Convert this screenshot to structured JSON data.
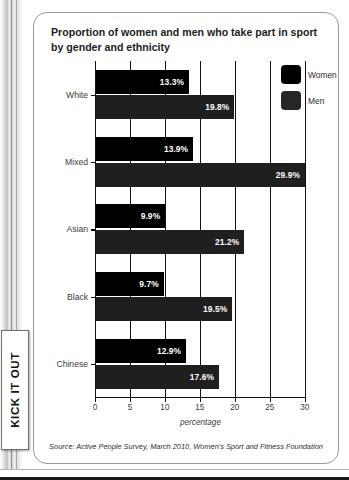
{
  "brand": {
    "tab_label": "KICK IT OUT"
  },
  "card": {
    "title": "Proportion of women and men who take part in sport by gender and ethnicity",
    "source": "Source: Active People Survey, March 2010, Women's Sport and Fitness Foundation"
  },
  "legend": {
    "items": [
      {
        "label": "Women",
        "color": "#000000"
      },
      {
        "label": "Men",
        "color": "#262626"
      }
    ]
  },
  "axis": {
    "x_ticks": [
      "0",
      "5",
      "10",
      "15",
      "20",
      "25",
      "30"
    ],
    "x_title": "percentage"
  },
  "chart_data": {
    "type": "bar",
    "orientation": "horizontal",
    "title": "Proportion of women and men who take part in sport by gender and ethnicity",
    "xlabel": "percentage",
    "ylabel": "",
    "xlim": [
      0,
      30
    ],
    "xticks": [
      0,
      5,
      10,
      15,
      20,
      25,
      30
    ],
    "grid": true,
    "legend_position": "top-right",
    "categories": [
      "White",
      "Mixed",
      "Asian",
      "Black",
      "Chinese"
    ],
    "series": [
      {
        "name": "Women",
        "color": "#000000",
        "values": [
          13.3,
          13.9,
          9.9,
          9.7,
          12.9
        ],
        "labels": [
          "13.3%",
          "13.9%",
          "9.9%",
          "9.7%",
          "12.9%"
        ]
      },
      {
        "name": "Men",
        "color": "#1f1f1f",
        "values": [
          19.8,
          29.9,
          21.2,
          19.5,
          17.6
        ],
        "labels": [
          "19.8%",
          "29.9%",
          "21.2%",
          "19.5%",
          "17.6%"
        ]
      }
    ],
    "source": "Source: Active People Survey, March 2010, Women's Sport and Fitness Foundation"
  }
}
